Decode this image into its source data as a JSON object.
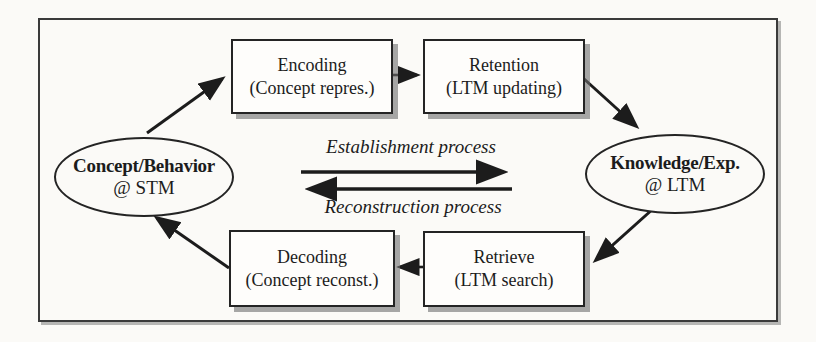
{
  "diagram": {
    "nodes": {
      "stm": {
        "title": "Concept/Behavior",
        "subtitle": "@ STM"
      },
      "ltm": {
        "title": "Knowledge/Exp.",
        "subtitle": "@ LTM"
      },
      "encoding": {
        "title": "Encoding",
        "subtitle": "(Concept repres.)"
      },
      "retention": {
        "title": "Retention",
        "subtitle": "(LTM updating)"
      },
      "decoding": {
        "title": "Decoding",
        "subtitle": "(Concept reconst.)"
      },
      "retrieve": {
        "title": "Retrieve",
        "subtitle": "(LTM search)"
      }
    },
    "labels": {
      "establishment": "Establishment process",
      "reconstruction": "Reconstruction process"
    },
    "flow": {
      "establishment_path": [
        "stm",
        "encoding",
        "retention",
        "ltm"
      ],
      "reconstruction_path": [
        "ltm",
        "retrieve",
        "decoding",
        "stm"
      ]
    },
    "colors": {
      "ink": "#1c1c1c",
      "paper": "#fbfaf7",
      "node_fill": "#fefdfb",
      "shadow": "#6e6e6e"
    }
  }
}
